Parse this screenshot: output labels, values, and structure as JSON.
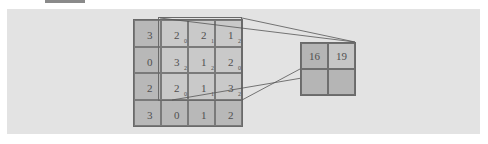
{
  "diagram": {
    "input": {
      "values": [
        [
          "3",
          "2",
          "2",
          "1"
        ],
        [
          "0",
          "3",
          "1",
          "2"
        ],
        [
          "2",
          "2",
          "1",
          "3"
        ],
        [
          "3",
          "0",
          "1",
          "2"
        ]
      ],
      "kernel_weights": [
        [
          "",
          "0",
          "1",
          "2"
        ],
        [
          "",
          "2",
          "2",
          "0"
        ],
        [
          "",
          "0",
          "1",
          "2"
        ],
        [
          "",
          "",
          "",
          ""
        ]
      ]
    },
    "output": {
      "values": [
        [
          "16",
          "19"
        ],
        [
          "",
          ""
        ]
      ]
    },
    "colors": {
      "panel": "#e3e3e3",
      "cell": "#b8b8b8",
      "highlight": "#c9c9c9",
      "border": "#6a6a6a"
    }
  }
}
